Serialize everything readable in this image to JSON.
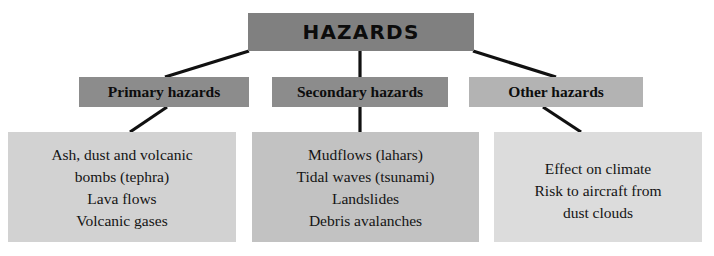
{
  "diagram": {
    "title": "HAZARDS",
    "root": {
      "label": "HAZARDS",
      "color": "#808080"
    },
    "categories": [
      {
        "id": "primary",
        "label": "Primary hazards",
        "color": "#8c8c8c",
        "detail_color": "#d2d2d2",
        "items": "Ash, dust and volcanic\nbombs (tephra)\nLava flows\nVolcanic gases"
      },
      {
        "id": "secondary",
        "label": "Secondary hazards",
        "color": "#8c8c8c",
        "detail_color": "#c2c2c2",
        "items": "Mudflows (lahars)\nTidal waves (tsunami)\nLandslides\nDebris avalanches"
      },
      {
        "id": "other",
        "label": "Other hazards",
        "color": "#b3b3b3",
        "detail_color": "#dcdcdc",
        "items": "Effect on climate\nRisk to aircraft from\ndust clouds"
      }
    ],
    "connector_color": "#111111"
  }
}
